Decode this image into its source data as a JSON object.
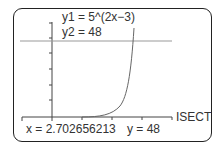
{
  "calculator": {
    "equations": {
      "y1": "y1 = 5^(2x−3)",
      "y2": "y2 = 48"
    },
    "mode_label": "ISECT",
    "result": {
      "x_label": "x = 2.702656213",
      "y_label": "y = 48"
    }
  },
  "colors": {
    "frame": "#222222",
    "axes": "#444444",
    "line": "#999999",
    "curve": "#666666",
    "text": "#333333"
  }
}
